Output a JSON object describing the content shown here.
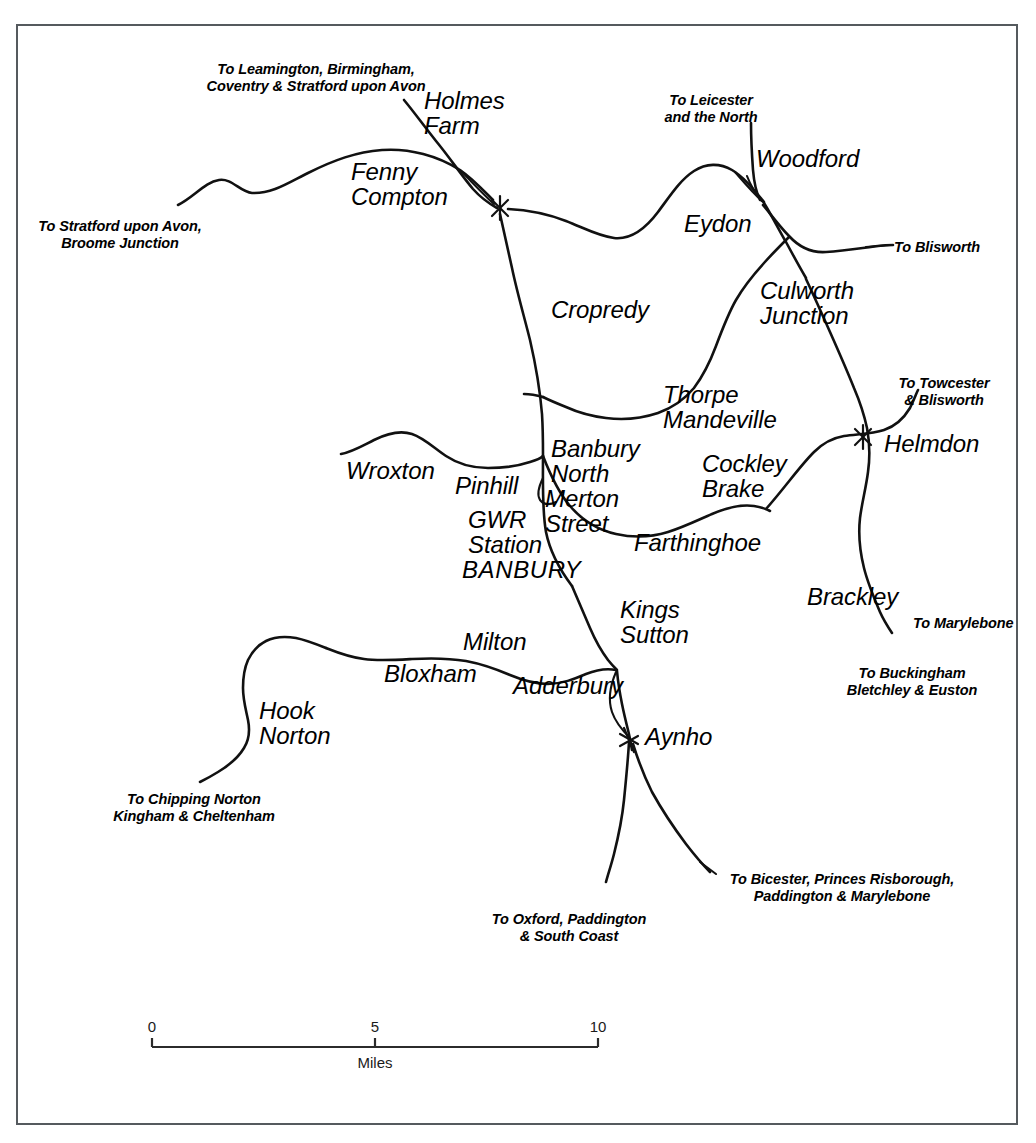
{
  "map": {
    "title": "Banbury Area Railway Network Map",
    "frame_color": "#555a5e",
    "line_color": "#111111",
    "background": "#ffffff"
  },
  "stations": [
    {
      "id": "holmes-farm",
      "label": "Holmes\nFarm",
      "x": 424,
      "y": 94,
      "align": "left"
    },
    {
      "id": "fenny-compton",
      "label": "Fenny\nCompton",
      "x": 351,
      "y": 163,
      "align": "left"
    },
    {
      "id": "woodford",
      "label": "Woodford",
      "x": 756,
      "y": 148,
      "align": "left"
    },
    {
      "id": "eydon",
      "label": "Eydon",
      "x": 684,
      "y": 213,
      "align": "left"
    },
    {
      "id": "culworth-junction",
      "label": "Culworth\nJunction",
      "x": 760,
      "y": 280,
      "align": "left"
    },
    {
      "id": "cropredy",
      "label": "Cropredy",
      "x": 551,
      "y": 298,
      "align": "left"
    },
    {
      "id": "thorpe-mandeville",
      "label": "Thorpe\nMandeville",
      "x": 663,
      "y": 383,
      "align": "left"
    },
    {
      "id": "helmdon",
      "label": "Helmdon",
      "x": 884,
      "y": 432,
      "align": "left"
    },
    {
      "id": "wroxton",
      "label": "Wroxton",
      "x": 346,
      "y": 459,
      "align": "left"
    },
    {
      "id": "banbury-north",
      "label": "Banbury\nNorth",
      "x": 551,
      "y": 437,
      "align": "left"
    },
    {
      "id": "pinhill",
      "label": "Pinhill",
      "x": 455,
      "y": 474,
      "align": "left"
    },
    {
      "id": "cockley-brake",
      "label": "Cockley\nBrake",
      "x": 702,
      "y": 452,
      "align": "left"
    },
    {
      "id": "merton-street",
      "label": "Merton\nStreet",
      "x": 545,
      "y": 487,
      "align": "left"
    },
    {
      "id": "gwr-station",
      "label": "GWR\nStation",
      "x": 468,
      "y": 508,
      "align": "left"
    },
    {
      "id": "farthinghoe",
      "label": "Farthinghoe",
      "x": 634,
      "y": 531,
      "align": "left"
    },
    {
      "id": "banbury",
      "label": "BANBURY",
      "x": 462,
      "y": 558,
      "align": "left"
    },
    {
      "id": "brackley",
      "label": "Brackley",
      "x": 807,
      "y": 585,
      "align": "left"
    },
    {
      "id": "kings-sutton",
      "label": "Kings\nSutton",
      "x": 620,
      "y": 598,
      "align": "left"
    },
    {
      "id": "milton",
      "label": "Milton",
      "x": 463,
      "y": 630,
      "align": "left"
    },
    {
      "id": "bloxham",
      "label": "Bloxham",
      "x": 384,
      "y": 662,
      "align": "left"
    },
    {
      "id": "adderbury",
      "label": "Adderbury",
      "x": 513,
      "y": 674,
      "align": "left"
    },
    {
      "id": "hook-norton",
      "label": "Hook\nNorton",
      "x": 259,
      "y": 699,
      "align": "left"
    },
    {
      "id": "aynho",
      "label": "Aynho",
      "x": 645,
      "y": 725,
      "align": "left"
    }
  ],
  "destinations": [
    {
      "id": "leamington",
      "label": "To Leamington, Birmingham,\nCoventry & Stratford upon Avon",
      "x": 202,
      "y": 60,
      "align": "center",
      "w": 228
    },
    {
      "id": "leicester",
      "label": "To Leicester\nand the North",
      "x": 662,
      "y": 91,
      "align": "center",
      "w": 104
    },
    {
      "id": "stratford",
      "label": "To Stratford upon Avon,\nBroome Junction",
      "x": 35,
      "y": 217,
      "align": "center",
      "w": 170
    },
    {
      "id": "blisworth",
      "label": "To Blisworth",
      "x": 894,
      "y": 243,
      "align": "left",
      "w": 100
    },
    {
      "id": "towcester",
      "label": "To Towcester\n& Blisworth",
      "x": 896,
      "y": 375,
      "align": "center",
      "w": 100
    },
    {
      "id": "marylebone",
      "label": "To Marylebone",
      "x": 913,
      "y": 619,
      "align": "left",
      "w": 110
    },
    {
      "id": "buckingham",
      "label": "To Buckingham\nBletchley & Euston",
      "x": 846,
      "y": 664,
      "align": "center",
      "w": 134
    },
    {
      "id": "chipping-norton",
      "label": "To Chipping Norton\nKingham & Cheltenham",
      "x": 112,
      "y": 790,
      "align": "center",
      "w": 166
    },
    {
      "id": "bicester",
      "label": "To Bicester, Princes Risborough,\nPaddington & Marylebone",
      "x": 718,
      "y": 871,
      "align": "center",
      "w": 242
    },
    {
      "id": "oxford",
      "label": "To Oxford, Paddington\n& South Coast",
      "x": 490,
      "y": 911,
      "align": "center",
      "w": 158
    }
  ],
  "scale_bar": {
    "unit_label": "Miles",
    "ticks": [
      {
        "value": "0",
        "x": 152
      },
      {
        "value": "5",
        "x": 374
      },
      {
        "value": "10",
        "x": 596
      }
    ],
    "bar_y": 1047,
    "left_x": 152,
    "right_x": 598
  }
}
